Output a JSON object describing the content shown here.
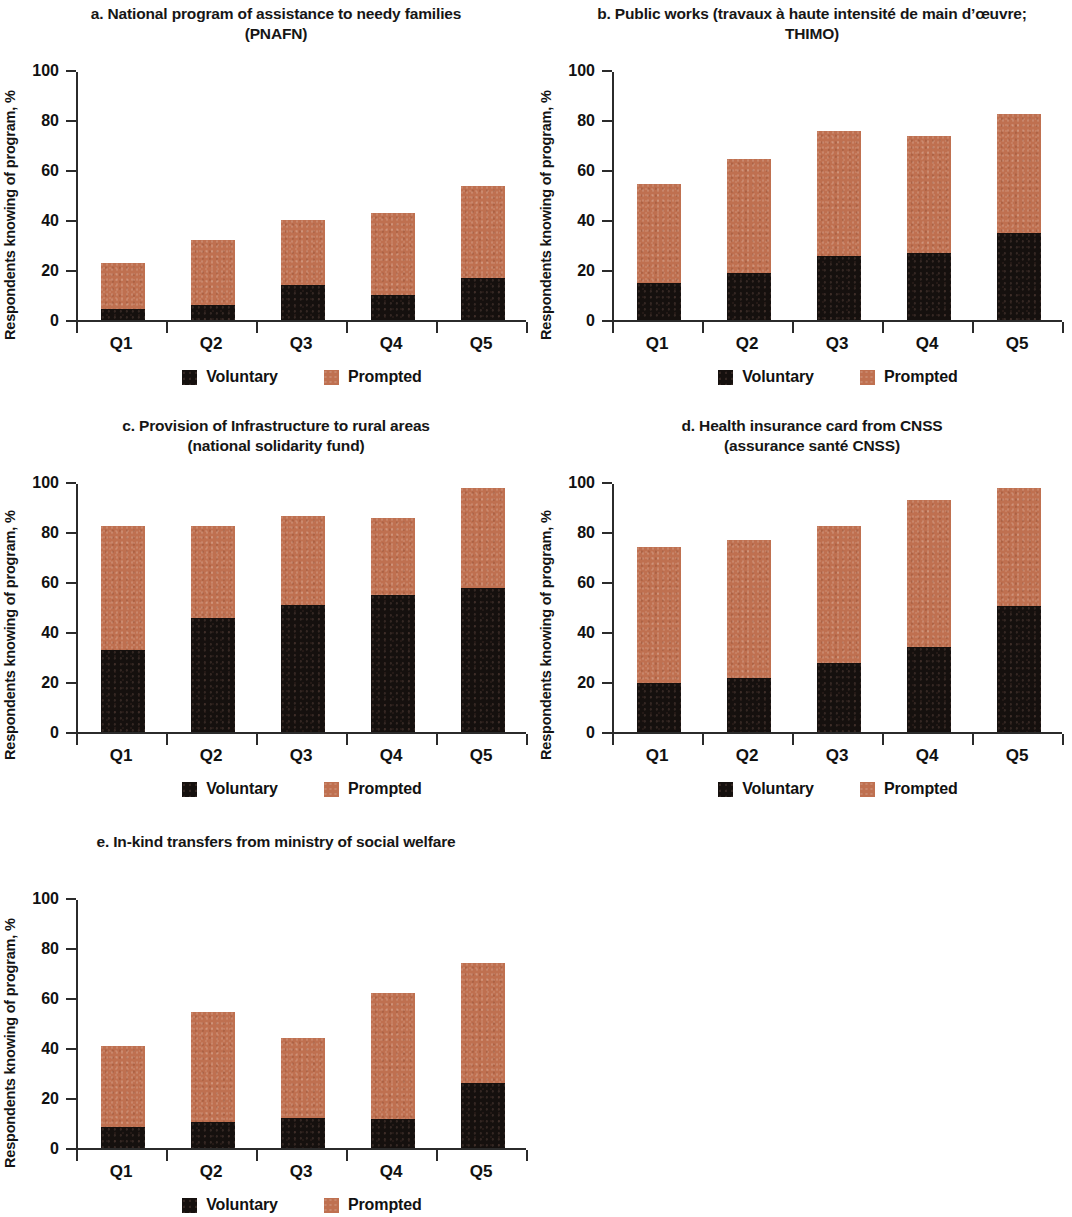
{
  "figure": {
    "axis": {
      "y_label": "Respondents knowing of program, %",
      "y_ticks": [
        "0",
        "20",
        "40",
        "60",
        "80",
        "100"
      ],
      "y_min": 0,
      "y_max": 100,
      "x_categories": [
        "Q1",
        "Q2",
        "Q3",
        "Q4",
        "Q5"
      ]
    },
    "legend": {
      "voluntary_label": "Voluntary",
      "prompted_label": "Prompted",
      "voluntary_color": "#15100e",
      "prompted_color": "#bf7050"
    }
  },
  "panels": [
    {
      "id": "panel-a",
      "title_line1": "a. National program of assistance to needy families",
      "title_line2": "(PNAFN)"
    },
    {
      "id": "panel-b",
      "title_line1": "b. Public works (travaux à haute intensité de main d’œuvre;",
      "title_line2": "THIMO)"
    },
    {
      "id": "panel-c",
      "title_line1": "c. Provision of Infrastructure to rural areas",
      "title_line2": "(national solidarity fund)"
    },
    {
      "id": "panel-d",
      "title_line1": "d. Health insurance card from CNSS",
      "title_line2": "(assurance santé CNSS)"
    },
    {
      "id": "panel-e",
      "title_line1": "e. In-kind transfers from ministry of social welfare",
      "title_line2": ""
    }
  ],
  "chart_data": [
    {
      "type": "bar",
      "stacked": true,
      "panel": "a",
      "title": "a. National program of assistance to needy families (PNAFN)",
      "xlabel": "",
      "ylabel": "Respondents knowing of program, %",
      "ylim": [
        0,
        100
      ],
      "yticks": [
        0,
        20,
        40,
        60,
        80,
        100
      ],
      "grid": false,
      "legend_position": "bottom",
      "categories": [
        "Q1",
        "Q2",
        "Q3",
        "Q4",
        "Q5"
      ],
      "series": [
        {
          "name": "Voluntary",
          "color": "#15100e",
          "values": [
            4.5,
            6,
            14,
            10,
            17
          ]
        },
        {
          "name": "Prompted",
          "color": "#bf7050",
          "values": [
            18.5,
            26,
            26,
            33,
            36.5
          ]
        }
      ],
      "totals": [
        23,
        32,
        40,
        43,
        53.5
      ]
    },
    {
      "type": "bar",
      "stacked": true,
      "panel": "b",
      "title": "b. Public works (travaux à haute intensité de main d’œuvre; THIMO)",
      "xlabel": "",
      "ylabel": "Respondents knowing of program, %",
      "ylim": [
        0,
        100
      ],
      "yticks": [
        0,
        20,
        40,
        60,
        80,
        100
      ],
      "grid": false,
      "legend_position": "bottom",
      "categories": [
        "Q1",
        "Q2",
        "Q3",
        "Q4",
        "Q5"
      ],
      "series": [
        {
          "name": "Voluntary",
          "color": "#15100e",
          "values": [
            15,
            19,
            25.5,
            27,
            35
          ]
        },
        {
          "name": "Prompted",
          "color": "#bf7050",
          "values": [
            39.5,
            45.5,
            50,
            46.5,
            47.5
          ]
        }
      ],
      "totals": [
        54.5,
        64.5,
        75.5,
        73.5,
        82.5
      ]
    },
    {
      "type": "bar",
      "stacked": true,
      "panel": "c",
      "title": "c. Provision of Infrastructure to rural areas (national solidarity fund)",
      "xlabel": "",
      "ylabel": "Respondents knowing of program, %",
      "ylim": [
        0,
        100
      ],
      "yticks": [
        0,
        20,
        40,
        60,
        80,
        100
      ],
      "grid": false,
      "legend_position": "bottom",
      "categories": [
        "Q1",
        "Q2",
        "Q3",
        "Q4",
        "Q5"
      ],
      "series": [
        {
          "name": "Voluntary",
          "color": "#15100e",
          "values": [
            33,
            45.5,
            51,
            55,
            57.5
          ]
        },
        {
          "name": "Prompted",
          "color": "#bf7050",
          "values": [
            49.5,
            37,
            35.5,
            30.5,
            40
          ]
        }
      ],
      "totals": [
        82.5,
        82.5,
        86.5,
        85.5,
        97.5
      ]
    },
    {
      "type": "bar",
      "stacked": true,
      "panel": "d",
      "title": "d. Health insurance card from CNSS (assurance santé CNSS)",
      "xlabel": "",
      "ylabel": "Respondents knowing of program, %",
      "ylim": [
        0,
        100
      ],
      "yticks": [
        0,
        20,
        40,
        60,
        80,
        100
      ],
      "grid": false,
      "legend_position": "bottom",
      "categories": [
        "Q1",
        "Q2",
        "Q3",
        "Q4",
        "Q5"
      ],
      "series": [
        {
          "name": "Voluntary",
          "color": "#15100e",
          "values": [
            19.5,
            21.5,
            27.5,
            34,
            50.5
          ]
        },
        {
          "name": "Prompted",
          "color": "#bf7050",
          "values": [
            54.5,
            55.5,
            55,
            59,
            47
          ]
        }
      ],
      "totals": [
        74,
        77,
        82.5,
        93,
        97.5
      ]
    },
    {
      "type": "bar",
      "stacked": true,
      "panel": "e",
      "title": "e. In-kind transfers from ministry of social welfare",
      "xlabel": "",
      "ylabel": "Respondents knowing of program, %",
      "ylim": [
        0,
        100
      ],
      "yticks": [
        0,
        20,
        40,
        60,
        80,
        100
      ],
      "grid": false,
      "legend_position": "bottom",
      "categories": [
        "Q1",
        "Q2",
        "Q3",
        "Q4",
        "Q5"
      ],
      "series": [
        {
          "name": "Voluntary",
          "color": "#15100e",
          "values": [
            8.5,
            10.5,
            12,
            11.5,
            26
          ]
        },
        {
          "name": "Prompted",
          "color": "#bf7050",
          "values": [
            32.5,
            44,
            32,
            50.5,
            48
          ]
        }
      ],
      "totals": [
        41,
        54.5,
        44,
        62,
        74
      ]
    }
  ]
}
